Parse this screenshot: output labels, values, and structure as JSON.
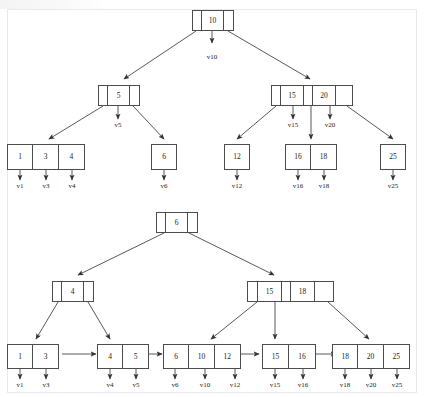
{
  "figure": {
    "stroke_color": "#4c4c4c",
    "text_color": "#222222",
    "background": "#ffffff"
  },
  "diagrams": [
    {
      "name": "upper-tree",
      "root": {
        "keys": [
          "10"
        ],
        "pointer_labels": [
          "v10"
        ]
      },
      "internal": [
        {
          "keys": [
            "5"
          ],
          "pointer_labels": [
            "v5"
          ]
        },
        {
          "keys": [
            "15",
            "20"
          ],
          "pointer_labels": [
            "v15",
            "v20"
          ]
        }
      ],
      "leaves": [
        {
          "keys": [
            "1",
            "3",
            "4"
          ],
          "pointer_labels": [
            "v1",
            "v3",
            "v4"
          ]
        },
        {
          "keys": [
            "6"
          ],
          "pointer_labels": [
            "v6"
          ]
        },
        {
          "keys": [
            "12"
          ],
          "pointer_labels": [
            "v12"
          ]
        },
        {
          "keys": [
            "16",
            "18"
          ],
          "pointer_labels": [
            "v16",
            "v18"
          ]
        },
        {
          "keys": [
            "25"
          ],
          "pointer_labels": [
            "v25"
          ]
        }
      ]
    },
    {
      "name": "lower-tree",
      "root": {
        "keys": [
          "6"
        ],
        "pointer_labels": []
      },
      "internal": [
        {
          "keys": [
            "4"
          ],
          "pointer_labels": []
        },
        {
          "keys": [
            "15",
            "18"
          ],
          "pointer_labels": []
        }
      ],
      "leaves": [
        {
          "keys": [
            "1",
            "3"
          ],
          "pointer_labels": [
            "v1",
            "v3"
          ]
        },
        {
          "keys": [
            "4",
            "5"
          ],
          "pointer_labels": [
            "v4",
            "v5"
          ]
        },
        {
          "keys": [
            "6",
            "10",
            "12"
          ],
          "pointer_labels": [
            "v6",
            "v10",
            "v12"
          ]
        },
        {
          "keys": [
            "15",
            "16"
          ],
          "pointer_labels": [
            "v15",
            "v16"
          ]
        },
        {
          "keys": [
            "18",
            "20",
            "25"
          ],
          "pointer_labels": [
            "v18",
            "v20",
            "v25"
          ]
        }
      ]
    }
  ],
  "nodes": {
    "t_root": {
      "cells": [
        "",
        "10",
        ""
      ]
    },
    "t_int_l": {
      "cells": [
        "",
        "5",
        ""
      ]
    },
    "t_int_r": {
      "cells": [
        "",
        "15",
        "",
        "20",
        ""
      ]
    },
    "t_leaf1": {
      "cells": [
        "1",
        "3",
        "4"
      ]
    },
    "t_leaf2": {
      "cells": [
        "6"
      ]
    },
    "t_leaf3": {
      "cells": [
        "12"
      ]
    },
    "t_leaf4": {
      "cells": [
        "16",
        "18"
      ]
    },
    "t_leaf5": {
      "cells": [
        "25"
      ]
    },
    "b_root": {
      "cells": [
        "",
        "6",
        ""
      ]
    },
    "b_int_l": {
      "cells": [
        "",
        "4",
        ""
      ]
    },
    "b_int_r": {
      "cells": [
        "",
        "15",
        "",
        "18",
        ""
      ]
    },
    "b_leaf1": {
      "cells": [
        "1",
        "3"
      ]
    },
    "b_leaf2": {
      "cells": [
        "4",
        "5"
      ]
    },
    "b_leaf3": {
      "cells": [
        "6",
        "10",
        "12"
      ]
    },
    "b_leaf4": {
      "cells": [
        "15",
        "16"
      ]
    },
    "b_leaf5": {
      "cells": [
        "18",
        "20",
        "25"
      ]
    }
  },
  "labels": {
    "t_v10": "v10",
    "t_v5": "v5",
    "t_v15": "v15",
    "t_v20": "v20",
    "t_v1": "v1",
    "t_v3": "v3",
    "t_v4": "v4",
    "t_v6": "v6",
    "t_v12": "v12",
    "t_v16": "v16",
    "t_v18": "v18",
    "t_v25": "v25",
    "b_v1": "v1",
    "b_v3": "v3",
    "b_v4": "v4",
    "b_v5": "v5",
    "b_v6": "v6",
    "b_v10": "v10",
    "b_v12": "v12",
    "b_v15": "v15",
    "b_v16": "v16",
    "b_v18": "v18",
    "b_v20": "v20",
    "b_v25": "v25"
  }
}
